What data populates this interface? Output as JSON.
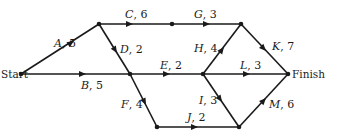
{
  "diagram": {
    "type": "activity-network",
    "terminals": {
      "start": {
        "label": "Start",
        "x": 21,
        "y": 74
      },
      "finish": {
        "label": "Finish",
        "x": 288,
        "y": 74
      }
    },
    "nodes": [
      {
        "id": "start",
        "x": 21,
        "y": 74
      },
      {
        "id": "n1",
        "x": 99,
        "y": 24
      },
      {
        "id": "n2",
        "x": 172,
        "y": 24
      },
      {
        "id": "n3",
        "x": 241,
        "y": 24
      },
      {
        "id": "n4",
        "x": 130,
        "y": 74
      },
      {
        "id": "n5",
        "x": 203,
        "y": 74
      },
      {
        "id": "finish",
        "x": 288,
        "y": 74
      },
      {
        "id": "n6",
        "x": 157,
        "y": 127
      },
      {
        "id": "n7",
        "x": 239,
        "y": 127
      }
    ],
    "edges": [
      {
        "activity": "A",
        "duration": "5",
        "from": "start",
        "to": "n1"
      },
      {
        "activity": "B",
        "duration": "5",
        "from": "start",
        "to": "n4"
      },
      {
        "activity": "C",
        "duration": "6",
        "from": "n1",
        "to": "n2"
      },
      {
        "activity": "D",
        "duration": "2",
        "from": "n1",
        "to": "n4"
      },
      {
        "activity": "E",
        "duration": "2",
        "from": "n4",
        "to": "n5"
      },
      {
        "activity": "F",
        "duration": "4",
        "from": "n4",
        "to": "n6"
      },
      {
        "activity": "G",
        "duration": "3",
        "from": "n2",
        "to": "n3"
      },
      {
        "activity": "H",
        "duration": "4",
        "from": "n5",
        "to": "n3"
      },
      {
        "activity": "I",
        "duration": "3",
        "from": "n5",
        "to": "n7"
      },
      {
        "activity": "J",
        "duration": "2",
        "from": "n6",
        "to": "n7"
      },
      {
        "activity": "K",
        "duration": "7",
        "from": "n3",
        "to": "finish"
      },
      {
        "activity": "L",
        "duration": "3",
        "from": "n5",
        "to": "finish"
      },
      {
        "activity": "M",
        "duration": "6",
        "from": "n7",
        "to": "finish"
      }
    ],
    "labels": {
      "A": {
        "name": "A",
        "sep": ", ",
        "dur": "5"
      },
      "B": {
        "name": "B",
        "sep": ", ",
        "dur": "5"
      },
      "C": {
        "name": "C",
        "sep": ", ",
        "dur": "6"
      },
      "D": {
        "name": "D",
        "sep": ", ",
        "dur": "2"
      },
      "E": {
        "name": "E",
        "sep": ", ",
        "dur": "2"
      },
      "F": {
        "name": "F",
        "sep": ", ",
        "dur": "4"
      },
      "G": {
        "name": "G",
        "sep": ", ",
        "dur": "3"
      },
      "H": {
        "name": "H",
        "sep": ", ",
        "dur": "4"
      },
      "I": {
        "name": "I",
        "sep": ", ",
        "dur": "3"
      },
      "J": {
        "name": "J",
        "sep": ", ",
        "dur": "2"
      },
      "K": {
        "name": "K",
        "sep": ", ",
        "dur": "7"
      },
      "L": {
        "name": "L",
        "sep": ", ",
        "dur": "3"
      },
      "M": {
        "name": "M",
        "sep": ", ",
        "dur": "6"
      }
    }
  }
}
